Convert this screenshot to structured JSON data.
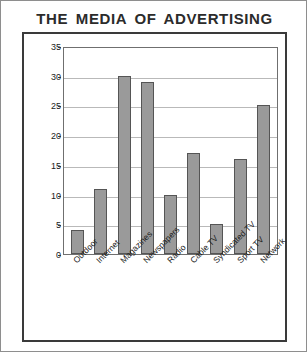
{
  "chart_data": {
    "type": "bar",
    "title": "THE MEDIA OF ADVERTISING",
    "xlabel": "",
    "ylabel": "Billions of Dollars",
    "ylim": [
      0,
      35
    ],
    "ytick_step": 5,
    "yticks": [
      "0",
      "5",
      "10",
      "15",
      "20",
      "25",
      "30",
      "35"
    ],
    "grid": true,
    "legend": false,
    "bar_color": "#9a9a9a",
    "bar_border_color": "#555555",
    "categories": [
      "Outdoor",
      "Internet",
      "Magazines",
      "Newspapers",
      "Radio",
      "Cable TV",
      "Syndicated TV",
      "Sport TV",
      "Network"
    ],
    "values": [
      4,
      11,
      30,
      29,
      10,
      17,
      5,
      16,
      25
    ]
  }
}
